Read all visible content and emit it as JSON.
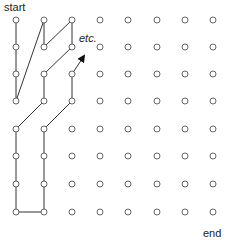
{
  "labels": {
    "start": "start",
    "end": "end",
    "etc": "etc."
  },
  "grid": {
    "columns": 8,
    "rows": 8,
    "x": [
      16,
      44,
      72,
      100,
      128,
      157,
      185,
      213
    ],
    "y": [
      20,
      47,
      74,
      101,
      129,
      156,
      184,
      212
    ],
    "point_radius": 3,
    "point_color": "#555555"
  },
  "path": {
    "color": "#333333",
    "points": [
      [
        0,
        0
      ],
      [
        0,
        1
      ],
      [
        0,
        2
      ],
      [
        0,
        3
      ],
      [
        1,
        0
      ],
      [
        1,
        1
      ],
      [
        2,
        0
      ],
      [
        2,
        1
      ],
      [
        1,
        2
      ],
      [
        1,
        3
      ],
      [
        0,
        4
      ],
      [
        0,
        5
      ],
      [
        0,
        6
      ],
      [
        0,
        7
      ],
      [
        1,
        7
      ],
      [
        1,
        6
      ],
      [
        1,
        5
      ],
      [
        1,
        4
      ],
      [
        2,
        3
      ],
      [
        2,
        2
      ]
    ],
    "arrow_end": [
      84,
      56
    ]
  }
}
